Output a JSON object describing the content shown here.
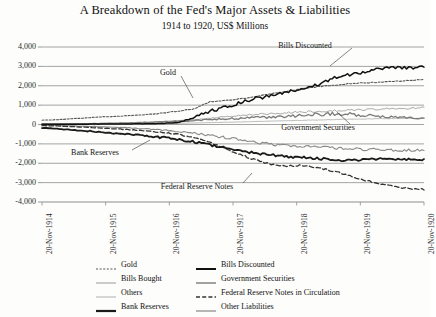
{
  "chart_data": {
    "type": "line",
    "title": "A Breakdown of the Fed's Major Assets & Liabilities",
    "subtitle": "1914 to 1920, US$ Millions",
    "xlabel": "",
    "ylabel": "",
    "ylim": [
      -4000,
      4000
    ],
    "yticks": [
      "4,000",
      "3,000",
      "2,000",
      "1,000",
      "0",
      "-1,000",
      "-2,000",
      "-3,000",
      "-4,000"
    ],
    "ytick_values": [
      4000,
      3000,
      2000,
      1000,
      0,
      -1000,
      -2000,
      -3000,
      -4000
    ],
    "xticks": [
      "20-Nov-1914",
      "20-Nov-1915",
      "20-Nov-1916",
      "20-Nov-1917",
      "20-Nov-1918",
      "20-Nov-1919",
      "20-Nov-1920"
    ],
    "grid": true,
    "legend_position": "bottom",
    "x": [
      1914.89,
      1915.0,
      1915.25,
      1915.5,
      1915.75,
      1916.0,
      1916.25,
      1916.5,
      1916.75,
      1917.0,
      1917.25,
      1917.5,
      1917.75,
      1918.0,
      1918.25,
      1918.5,
      1918.75,
      1919.0,
      1919.25,
      1919.5,
      1919.75,
      1920.0,
      1920.25,
      1920.5,
      1920.75,
      1920.89
    ],
    "series": [
      {
        "name": "Gold",
        "style": "dotted",
        "color": "#555555",
        "width": 1.1,
        "values": [
          220,
          250,
          300,
          350,
          400,
          430,
          470,
          520,
          600,
          700,
          820,
          1180,
          1250,
          1320,
          1450,
          1580,
          1700,
          1850,
          1950,
          2020,
          2100,
          2150,
          2180,
          2220,
          2280,
          2320
        ]
      },
      {
        "name": "Bills Discounted",
        "style": "solid",
        "color": "#111111",
        "width": 1.5,
        "values": [
          10,
          12,
          15,
          18,
          20,
          25,
          30,
          40,
          60,
          120,
          380,
          700,
          900,
          1150,
          1350,
          1500,
          1680,
          1850,
          2050,
          2400,
          2550,
          2700,
          2850,
          2950,
          2900,
          3000
        ]
      },
      {
        "name": "Bills Bought",
        "style": "solid",
        "color": "#aaaaaa",
        "width": 1.0,
        "values": [
          15,
          20,
          30,
          45,
          60,
          80,
          100,
          130,
          160,
          200,
          260,
          330,
          400,
          470,
          520,
          560,
          600,
          650,
          680,
          700,
          730,
          760,
          790,
          820,
          840,
          860
        ]
      },
      {
        "name": "Government Securities",
        "style": "solid",
        "color": "#7a7a7a",
        "width": 1.3,
        "values": [
          12,
          15,
          25,
          40,
          55,
          70,
          85,
          110,
          140,
          170,
          210,
          250,
          290,
          320,
          350,
          380,
          420,
          470,
          520,
          560,
          540,
          480,
          420,
          380,
          350,
          330
        ]
      },
      {
        "name": "Others",
        "style": "solid",
        "color": "#bcbcbc",
        "width": 1.0,
        "values": [
          8,
          10,
          14,
          18,
          22,
          28,
          34,
          42,
          52,
          64,
          78,
          95,
          115,
          135,
          155,
          175,
          195,
          215,
          235,
          255,
          270,
          285,
          295,
          305,
          315,
          320
        ]
      },
      {
        "name": "Federal Reserve Notes in Circulation",
        "style": "dashed",
        "color": "#333333",
        "width": 1.3,
        "values": [
          -60,
          -80,
          -110,
          -150,
          -190,
          -230,
          -280,
          -340,
          -420,
          -520,
          -700,
          -950,
          -1250,
          -1550,
          -1850,
          -2050,
          -2150,
          -2100,
          -2200,
          -2400,
          -2600,
          -2850,
          -3050,
          -3200,
          -3300,
          -3350
        ]
      },
      {
        "name": "Bank Reserves",
        "style": "solid",
        "color": "#1a1a1a",
        "width": 1.8,
        "values": [
          -180,
          -220,
          -280,
          -340,
          -400,
          -460,
          -520,
          -600,
          -680,
          -780,
          -900,
          -1050,
          -1200,
          -1350,
          -1480,
          -1580,
          -1650,
          -1700,
          -1750,
          -1800,
          -1850,
          -1800,
          -1780,
          -1820,
          -1800,
          -1820
        ]
      },
      {
        "name": "Other Liabilities",
        "style": "solid",
        "color": "#888888",
        "width": 1.1,
        "values": [
          -40,
          -50,
          -70,
          -95,
          -120,
          -150,
          -185,
          -230,
          -290,
          -360,
          -450,
          -560,
          -680,
          -800,
          -920,
          -1020,
          -1080,
          -1120,
          -1160,
          -1200,
          -1250,
          -1280,
          -1300,
          -1320,
          -1330,
          -1340
        ]
      }
    ],
    "annotations": [
      {
        "text": "Bills Discounted",
        "x": 305,
        "y": 45
      },
      {
        "text": "Gold",
        "x": 168,
        "y": 72
      },
      {
        "text": "Government Securities",
        "x": 318,
        "y": 127
      },
      {
        "text": "Bank Reserves",
        "x": 95,
        "y": 152
      },
      {
        "text": "Federal Reserve Notes",
        "x": 197,
        "y": 186
      }
    ]
  },
  "legend": {
    "items": [
      {
        "label": "Gold",
        "style": "dotted",
        "color": "#555555",
        "width": 1.1
      },
      {
        "label": "Bills Discounted",
        "style": "solid",
        "color": "#111111",
        "width": 2.0
      },
      {
        "label": "Bills Bought",
        "style": "solid",
        "color": "#aaaaaa",
        "width": 1.2
      },
      {
        "label": "Government Securities",
        "style": "solid",
        "color": "#7a7a7a",
        "width": 1.4
      },
      {
        "label": "Others",
        "style": "solid",
        "color": "#bcbcbc",
        "width": 1.2
      },
      {
        "label": "Federal Reserve Notes in Circulation",
        "style": "dashed",
        "color": "#333333",
        "width": 1.4
      },
      {
        "label": "Bank Reserves",
        "style": "solid",
        "color": "#1a1a1a",
        "width": 2.2
      },
      {
        "label": "Other Liabilities",
        "style": "solid",
        "color": "#888888",
        "width": 1.2
      }
    ],
    "order": [
      "Gold",
      "Bills Discounted",
      "Bills Bought",
      "Government Securities",
      "Others",
      "Federal Reserve Notes in Circulation",
      "Bank Reserves",
      "Other Liabilities"
    ]
  },
  "colors": {
    "grid": "#8d8d8d",
    "background": "#fdfdfc",
    "text": "#111111"
  }
}
